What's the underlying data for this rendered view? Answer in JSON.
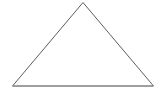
{
  "figure": {
    "kind": "line-drawing",
    "shape_name": "triangle",
    "canvas": {
      "width": 164,
      "height": 95,
      "background_color": "#ffffff"
    },
    "geometry": {
      "vertices": [
        {
          "name": "apex",
          "x": 83,
          "y": 2.5
        },
        {
          "name": "bottom-right",
          "x": 153.5,
          "y": 86
        },
        {
          "name": "bottom-left",
          "x": 12.5,
          "y": 86
        }
      ],
      "points_attr": "83,2.5 153.5,86 12.5,86",
      "base_y": 86,
      "base_x_start": 12.5,
      "base_x_end": 153.5,
      "base_width": 141,
      "height": 83.5
    },
    "style": {
      "side_stroke_color": "#5d5d5d",
      "side_stroke_width": 1,
      "base_stroke_color": "#8f8f8f",
      "base_stroke_width": 1.1,
      "fill": "none"
    },
    "labels": [],
    "text": []
  }
}
